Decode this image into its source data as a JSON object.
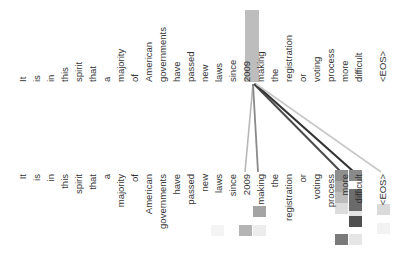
{
  "diagram": {
    "type": "attention-visualization",
    "source_tokens": [
      "It",
      "is",
      "in",
      "this",
      "spirit",
      "that",
      "a",
      "majority",
      "of",
      "American",
      "governments",
      "have",
      "passed",
      "new",
      "laws",
      "since",
      "2009",
      "making",
      "the",
      "registration",
      "or",
      "voting",
      "process",
      "more",
      "difficult",
      "<EOS>"
    ],
    "target_tokens": [
      "It",
      "is",
      "in",
      "this",
      "spirit",
      "that",
      "a",
      "majority",
      "of",
      "American",
      "governments",
      "have",
      "passed",
      "new",
      "laws",
      "since",
      "2009",
      "making",
      "the",
      "registration",
      "or",
      "voting",
      "process",
      "more",
      "difficult",
      "<EOS>"
    ],
    "highlighted_source": "making",
    "highlight_color": "#bdbdbd",
    "attention_links": [
      {
        "from": "making",
        "to": "2009",
        "color": "#b8b8b8"
      },
      {
        "from": "making",
        "to": "making",
        "color": "#8a8a8a"
      },
      {
        "from": "making",
        "to": "more",
        "color": "#4a4a4a"
      },
      {
        "from": "making",
        "to": "difficult",
        "color": "#333333"
      },
      {
        "from": "making",
        "to": "<EOS>",
        "color": "#c8c8c8"
      }
    ],
    "heatmap_cells": [
      {
        "token": "more",
        "row": 0,
        "color": "#8f8f8f"
      },
      {
        "token": "more",
        "row": 1,
        "color": "#a8a8a8"
      },
      {
        "token": "more",
        "row": 2,
        "color": "#bcbcbc"
      },
      {
        "token": "more",
        "row": 3,
        "color": "#dcdcdc"
      },
      {
        "token": "more",
        "row": 4,
        "color": "#7a7a7a"
      },
      {
        "token": "difficult",
        "row": 0,
        "color": "#8a8a8a"
      },
      {
        "token": "difficult",
        "row": 1,
        "color": "#6e6e6e"
      },
      {
        "token": "difficult",
        "row": 2,
        "color": "#6a6a6a"
      },
      {
        "token": "difficult",
        "row": 3,
        "color": "#e4e4e4"
      },
      {
        "token": "difficult",
        "row": 4,
        "color": "#4f4f4f"
      },
      {
        "token": "difficult",
        "row": 5,
        "color": "#e6e6e6"
      },
      {
        "token": "making",
        "row": 0,
        "color": "#a4a4a4"
      },
      {
        "token": "2009",
        "row": 0,
        "color": "#b4b4b4"
      },
      {
        "token": "making",
        "row": 1,
        "color": "#ececec"
      },
      {
        "token": "laws",
        "row": 0,
        "color": "#f4f4f4"
      },
      {
        "token": "<EOS>",
        "row": 0,
        "color": "#dadada"
      },
      {
        "token": "<EOS>",
        "row": 1,
        "color": "#f2f2f2"
      }
    ]
  }
}
